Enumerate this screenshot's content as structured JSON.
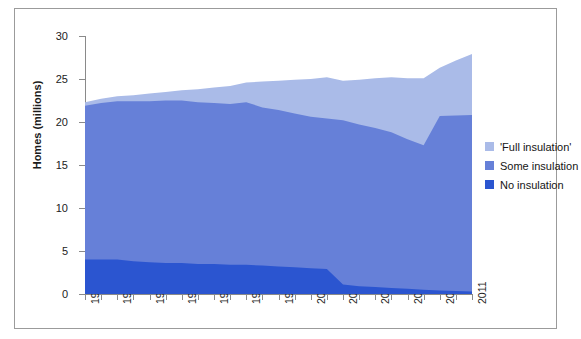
{
  "chart_data": {
    "type": "area",
    "stacked": true,
    "title": "",
    "xlabel": "",
    "ylabel": "Homes (millions)",
    "ylim": [
      0,
      30
    ],
    "ytick_values": [
      0,
      5,
      10,
      15,
      20,
      25,
      30
    ],
    "ytick_labels": [
      "0",
      "5",
      "10",
      "15",
      "20",
      "25",
      "30"
    ],
    "xlim": [
      1987,
      2011
    ],
    "grid": false,
    "legend_position": "right",
    "x": [
      1987,
      1988,
      1989,
      1990,
      1991,
      1992,
      1993,
      1994,
      1995,
      1996,
      1997,
      1998,
      1999,
      2000,
      2001,
      2002,
      2003,
      2004,
      2005,
      2006,
      2007,
      2008,
      2009,
      2010,
      2011
    ],
    "xtick_labels": [
      "1987",
      "1989",
      "1991",
      "1993",
      "1995",
      "1997",
      "1999",
      "2001",
      "2003",
      "2005",
      "2007",
      "2009",
      "2011"
    ],
    "xtick_values": [
      1987,
      1989,
      1991,
      1993,
      1995,
      1997,
      1999,
      2001,
      2003,
      2005,
      2007,
      2009,
      2011
    ],
    "series": [
      {
        "name": "No insulation",
        "color": "#2b55d0",
        "values": [
          4.0,
          4.0,
          4.0,
          3.8,
          3.7,
          3.6,
          3.6,
          3.5,
          3.5,
          3.4,
          3.4,
          3.3,
          3.2,
          3.1,
          3.0,
          2.9,
          1.1,
          0.9,
          0.8,
          0.7,
          0.6,
          0.5,
          0.4,
          0.35,
          0.3
        ]
      },
      {
        "name": "Some insulation",
        "color": "#6680d8",
        "values": [
          17.9,
          18.2,
          18.4,
          18.6,
          18.7,
          18.9,
          18.9,
          18.8,
          18.7,
          18.7,
          18.9,
          18.4,
          18.2,
          17.9,
          17.6,
          17.5,
          19.1,
          18.8,
          18.5,
          18.1,
          17.4,
          16.8,
          20.3,
          20.4,
          20.5
        ]
      },
      {
        "name": "'Full insulation'",
        "color": "#aabbe8",
        "values": [
          0.4,
          0.5,
          0.6,
          0.7,
          0.9,
          1.0,
          1.2,
          1.5,
          1.8,
          2.1,
          2.3,
          3.0,
          3.4,
          3.9,
          4.4,
          4.8,
          4.6,
          5.2,
          5.8,
          6.4,
          7.1,
          7.8,
          5.6,
          6.4,
          7.1
        ]
      }
    ],
    "totals": [
      22.3,
      22.7,
      23.0,
      23.1,
      23.3,
      23.5,
      23.7,
      23.8,
      24.0,
      24.2,
      24.6,
      24.7,
      24.8,
      24.9,
      25.0,
      25.2,
      24.8,
      24.9,
      25.1,
      25.2,
      25.1,
      25.1,
      26.3,
      27.15,
      27.9
    ]
  },
  "legend": {
    "items": [
      {
        "label": "'Full insulation'",
        "color": "#aabbe8"
      },
      {
        "label": "Some insulation",
        "color": "#6680d8"
      },
      {
        "label": "No insulation",
        "color": "#2b55d0"
      }
    ]
  }
}
